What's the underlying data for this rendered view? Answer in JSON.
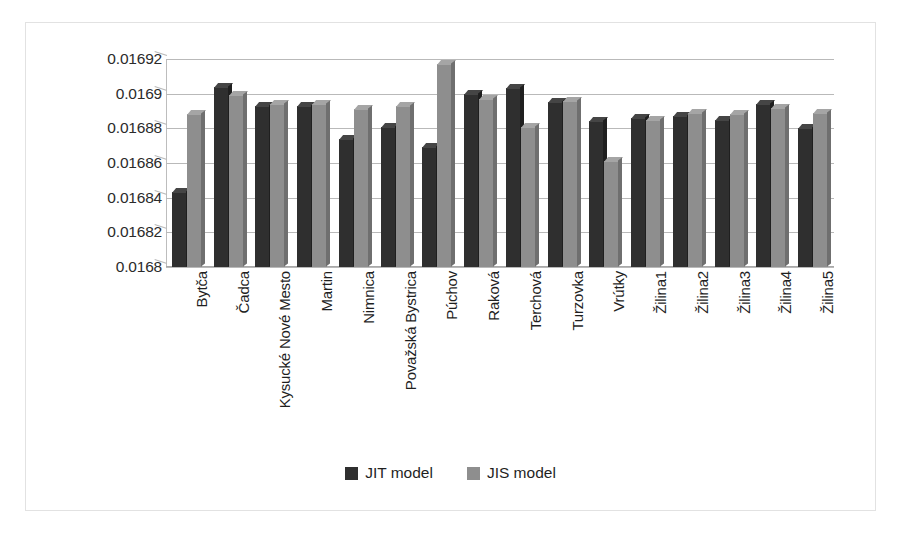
{
  "chart_data": {
    "type": "bar",
    "title": "",
    "xlabel": "",
    "ylabel": "",
    "ylim": [
      0.0168,
      0.01692
    ],
    "ytick_step": 2e-05,
    "yticks": [
      "0.01692",
      "0.0169",
      "0.01688",
      "0.01686",
      "0.01684",
      "0.01682",
      "0.0168"
    ],
    "ytick_values": [
      0.01692,
      0.0169,
      0.01688,
      0.01686,
      0.01684,
      0.01682,
      0.0168
    ],
    "grid": true,
    "legend_position": "bottom",
    "categories": [
      "Bytča",
      "Čadca",
      "Kysucké Nové Mesto",
      "Martin",
      "Nimnica",
      "Považská Bystrica",
      "Púchov",
      "Raková",
      "Terchová",
      "Turzovka",
      "Vrútky",
      "Žilina1",
      "Žilina2",
      "Žilina3",
      "Žilina4",
      "Žilina5"
    ],
    "series": [
      {
        "name": "JIT model",
        "color": "#2f2f2f",
        "values": [
          0.016843,
          0.016904,
          0.016893,
          0.016893,
          0.016874,
          0.016881,
          0.016869,
          0.0169,
          0.016903,
          0.016895,
          0.016884,
          0.016886,
          0.016887,
          0.016885,
          0.016894,
          0.01688
        ]
      },
      {
        "name": "JIS model",
        "color": "#8e8e8e",
        "values": [
          0.016888,
          0.016899,
          0.016894,
          0.016894,
          0.016891,
          0.016893,
          0.016917,
          0.016897,
          0.016881,
          0.016896,
          0.016861,
          0.016885,
          0.016889,
          0.016888,
          0.016892,
          0.016889
        ]
      }
    ]
  },
  "legend": {
    "items": [
      {
        "label": "JIT model",
        "key": "jit"
      },
      {
        "label": "JIS model",
        "key": "jis"
      }
    ]
  }
}
